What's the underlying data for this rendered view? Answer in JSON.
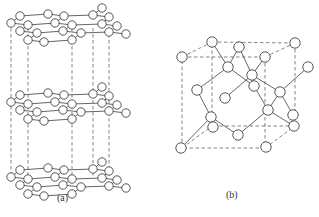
{
  "figure": {
    "panels": [
      {
        "id": "a",
        "label": "(a)",
        "subject": "graphite layered structure",
        "layer_count": 3,
        "label_pos": [
          64,
          199
        ]
      },
      {
        "id": "b",
        "label": "(b)",
        "subject": "diamond cubic structure",
        "label_pos": [
          233,
          196
        ]
      }
    ]
  },
  "graphite": {
    "layer_offsets_y": [
      0,
      79,
      154
    ],
    "atom_radius": 4.2,
    "atoms": [
      [
        20,
        16
      ],
      [
        48,
        14
      ],
      [
        64,
        16
      ],
      [
        93,
        15
      ],
      [
        102,
        8
      ],
      [
        109,
        17
      ],
      [
        11,
        23
      ],
      [
        28,
        25
      ],
      [
        55,
        23
      ],
      [
        72,
        25
      ],
      [
        102,
        24
      ],
      [
        117,
        26
      ],
      [
        20,
        31
      ],
      [
        37,
        33
      ],
      [
        63,
        31
      ],
      [
        81,
        33
      ],
      [
        109,
        32
      ],
      [
        126,
        34
      ],
      [
        28,
        40
      ],
      [
        44,
        42
      ],
      [
        72,
        40
      ]
    ],
    "bonds": [
      [
        20,
        16,
        48,
        14
      ],
      [
        48,
        14,
        64,
        16
      ],
      [
        64,
        16,
        93,
        15
      ],
      [
        93,
        15,
        102,
        8
      ],
      [
        93,
        15,
        109,
        17
      ],
      [
        11,
        23,
        20,
        16
      ],
      [
        11,
        23,
        28,
        25
      ],
      [
        28,
        25,
        55,
        23
      ],
      [
        55,
        23,
        64,
        16
      ],
      [
        55,
        23,
        72,
        25
      ],
      [
        72,
        25,
        102,
        24
      ],
      [
        102,
        24,
        109,
        17
      ],
      [
        102,
        24,
        117,
        26
      ],
      [
        20,
        31,
        28,
        25
      ],
      [
        20,
        31,
        37,
        33
      ],
      [
        37,
        33,
        63,
        31
      ],
      [
        63,
        31,
        72,
        25
      ],
      [
        63,
        31,
        81,
        33
      ],
      [
        81,
        33,
        109,
        32
      ],
      [
        109,
        32,
        117,
        26
      ],
      [
        109,
        32,
        126,
        34
      ],
      [
        28,
        40,
        37,
        33
      ],
      [
        28,
        40,
        44,
        42
      ],
      [
        44,
        42,
        72,
        40
      ],
      [
        72,
        40,
        81,
        33
      ]
    ],
    "verticals_x": [
      11,
      28,
      72,
      93,
      109
    ]
  },
  "diamond": {
    "atom_radius": 5.2,
    "cube_front": [
      [
        182,
        57
      ],
      [
        265,
        57
      ],
      [
        265,
        148
      ],
      [
        182,
        148
      ]
    ],
    "cube_back": [
      [
        212,
        42
      ],
      [
        295,
        43
      ],
      [
        295,
        126
      ],
      [
        212,
        126
      ]
    ],
    "atoms": [
      [
        182,
        57
      ],
      [
        212,
        42
      ],
      [
        239,
        47
      ],
      [
        295,
        43
      ],
      [
        265,
        57
      ],
      [
        228,
        67
      ],
      [
        252,
        75
      ],
      [
        254,
        86
      ],
      [
        280,
        92
      ],
      [
        308,
        67
      ],
      [
        197,
        90
      ],
      [
        225,
        98
      ],
      [
        268,
        110
      ],
      [
        293,
        115
      ],
      [
        294,
        126
      ],
      [
        211,
        117
      ],
      [
        213,
        127
      ],
      [
        238,
        135
      ],
      [
        266,
        147
      ],
      [
        181,
        148
      ]
    ],
    "bonds": [
      [
        212,
        42,
        228,
        67
      ],
      [
        239,
        47,
        228,
        67
      ],
      [
        228,
        67,
        197,
        90
      ],
      [
        228,
        67,
        254,
        86
      ],
      [
        265,
        57,
        252,
        75
      ],
      [
        252,
        75,
        239,
        47
      ],
      [
        252,
        75,
        225,
        98
      ],
      [
        252,
        75,
        280,
        92
      ],
      [
        254,
        86,
        268,
        110
      ],
      [
        280,
        92,
        308,
        67
      ],
      [
        280,
        92,
        268,
        110
      ],
      [
        280,
        92,
        293,
        115
      ],
      [
        197,
        90,
        211,
        117
      ],
      [
        211,
        117,
        181,
        148
      ],
      [
        211,
        117,
        238,
        135
      ],
      [
        238,
        135,
        268,
        110
      ],
      [
        268,
        110,
        294,
        126
      ]
    ]
  }
}
